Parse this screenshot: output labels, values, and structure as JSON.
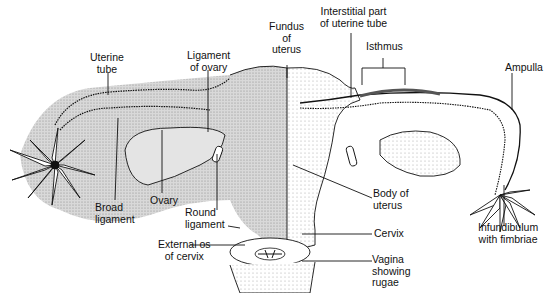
{
  "diagram": {
    "labels": {
      "uterine_tube": "Uterine\ntube",
      "ligament_of_ovary": "Ligament\nof ovary",
      "fundus_of_uterus": "Fundus\nof\nuterus",
      "interstitial_part": "Interstitial part\nof uterine tube",
      "isthmus": "Isthmus",
      "ampulla": "Ampulla",
      "broad_ligament": "Broad\nligament",
      "ovary": "Ovary",
      "round_ligament": "Round\nligament",
      "external_os": "External os\nof cervix",
      "body_of_uterus": "Body of\nuterus",
      "cervix": "Cervix",
      "vagina": "Vagina\nshowing\nrugae",
      "infundibulum": "Infundibulum\nwith fimbriae"
    },
    "colors": {
      "ink": "#111111",
      "shade": "#cfcfcf",
      "background": "#ffffff"
    }
  }
}
